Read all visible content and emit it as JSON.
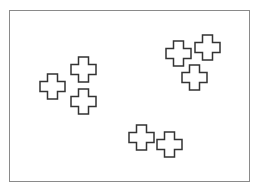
{
  "diagram": {
    "frame": {
      "x": 9,
      "y": 10,
      "width": 241,
      "height": 172,
      "border_color": "#8a8a8a"
    },
    "shape_style": {
      "type": "cross",
      "size": 25,
      "arm_width": 10,
      "stroke": "#333333",
      "stroke_width": 1.5,
      "fill": "none"
    },
    "groups": [
      {
        "name": "left-cluster",
        "crosses": [
          {
            "x": 40,
            "y": 74
          },
          {
            "x": 71,
            "y": 57
          },
          {
            "x": 71,
            "y": 89
          }
        ]
      },
      {
        "name": "top-right-cluster",
        "crosses": [
          {
            "x": 166,
            "y": 41
          },
          {
            "x": 195,
            "y": 35
          },
          {
            "x": 182,
            "y": 65
          }
        ]
      },
      {
        "name": "bottom-cluster",
        "crosses": [
          {
            "x": 129,
            "y": 125
          },
          {
            "x": 157,
            "y": 132
          }
        ]
      }
    ]
  }
}
